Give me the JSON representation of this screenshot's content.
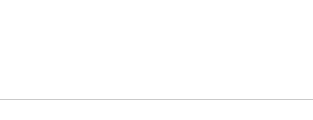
{
  "legend": {
    "items": [
      {
        "label": "Democrats",
        "color": "#4d4d4d"
      },
      {
        "label": "Independents",
        "color": "#8c8c8c"
      },
      {
        "label": "Republicans",
        "color": "#c9c9c9"
      }
    ]
  },
  "chart_data": {
    "type": "line",
    "title": "",
    "subtitle": "",
    "xlabel": "",
    "ylabel": "",
    "grid": "vertical",
    "legend_position": "top-left",
    "ylim": [
      15,
      80
    ],
    "categories": [
      "2003",
      "2004",
      "2005",
      "2006",
      "2007",
      "2008",
      "2009",
      "2010",
      "2011",
      "2012",
      "2013",
      "2014"
    ],
    "series": [
      {
        "name": "Democrats",
        "color": "#4d4d4d",
        "values": [
          38,
          null,
          null,
          50,
          48,
          40,
          47,
          49,
          40,
          52,
          52,
          47
        ],
        "labels": [
          "38",
          "",
          "",
          "50",
          "48",
          "40",
          "47",
          "49",
          "40",
          "52",
          "52",
          "47"
        ],
        "label_pos": [
          "below",
          "",
          "",
          "below",
          "above",
          "below",
          "above",
          "above",
          "below",
          "above",
          "above",
          "above"
        ]
      },
      {
        "name": "Independents",
        "color": "#8c8c8c",
        "values": [
          22,
          null,
          null,
          30,
          43,
          38,
          45,
          38,
          36,
          49,
          49,
          46
        ],
        "labels": [
          "22",
          "",
          "",
          "30",
          "43",
          "38",
          "45",
          "38",
          "36",
          "49",
          "49",
          "46"
        ],
        "label_pos": [
          "below",
          "",
          "",
          "below",
          "above",
          "below",
          "below",
          "below",
          "below",
          "below",
          "below",
          "below"
        ]
      },
      {
        "name": "Republicans",
        "color": "#b5b5b5",
        "values": [
          56,
          null,
          null,
          63,
          74,
          63,
          74,
          68,
          58,
          71,
          71,
          71
        ],
        "labels": [
          "56",
          "",
          "",
          "63",
          "74",
          "63",
          "74",
          "68",
          "58",
          "71",
          "71",
          "71"
        ],
        "label_pos": [
          "above",
          "",
          "",
          "above",
          "above",
          "above",
          "above",
          "above",
          "above",
          "above",
          "above",
          "above"
        ]
      }
    ]
  },
  "axis": {
    "ticks": [
      "2003",
      "2004",
      "2005",
      "2006",
      "2007",
      "2008",
      "2009",
      "2010",
      "2011",
      "2012",
      "2013",
      "2014"
    ]
  }
}
